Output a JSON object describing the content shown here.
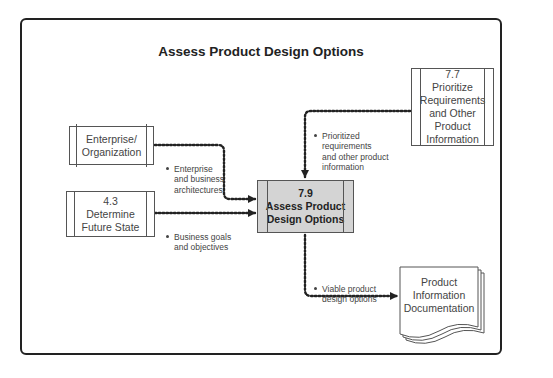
{
  "diagram": {
    "title": "Assess Product Design Options",
    "nodes": {
      "enterprise": {
        "label": "Enterprise/\nOrganization",
        "shape": "scroll"
      },
      "future_state": {
        "id": "4.3",
        "label": "Determine\nFuture State",
        "shape": "process"
      },
      "prioritize": {
        "id": "7.7",
        "label": "Prioritize\nRequirements\nand Other\nProduct\nInformation",
        "shape": "process"
      },
      "assess": {
        "id": "7.9",
        "label": "Assess Product\nDesign Options",
        "shape": "process",
        "fill": "#d4d4d4"
      },
      "doc": {
        "label": "Product\nInformation\nDocumentation",
        "shape": "document"
      }
    },
    "edges": [
      {
        "from": "enterprise",
        "to": "assess",
        "label": "Enterprise\nand business\narchitectures"
      },
      {
        "from": "future_state",
        "to": "assess",
        "label": "Business goals\nand objectives"
      },
      {
        "from": "prioritize",
        "to": "assess",
        "label": "Prioritized\nrequirements\nand other product\ninformation"
      },
      {
        "from": "assess",
        "to": "doc",
        "label": "Viable product\ndesign options"
      }
    ]
  }
}
